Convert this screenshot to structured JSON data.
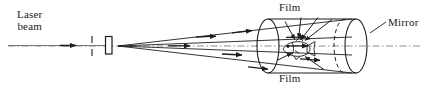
{
  "figure": {
    "domain": "diagram",
    "width": 426,
    "height": 88,
    "background": "#ffffff",
    "ink_color": "#1a1a1a",
    "ray_color": "#222222",
    "axis_color": "#8a8a8a"
  },
  "labels": {
    "laser_line1": "Laser",
    "laser_line2": "beam",
    "film_top": "Film",
    "film_bottom": "Film",
    "mirror": "Mirror"
  },
  "components": {
    "laser_beam": {
      "name": "laser-beam-line",
      "x_start": 8,
      "x_end": 108,
      "y": 45,
      "arrow_at_x": 74
    },
    "pinhole": {
      "name": "pinhole-aperture",
      "x": 92,
      "y_top": 36,
      "y_bottom": 54
    },
    "lens": {
      "name": "diverging-lens",
      "x": 106,
      "y_top": 36,
      "y_bottom": 54,
      "width": 7
    },
    "beam_origin": {
      "x": 118,
      "y": 46
    },
    "cylinder": {
      "name": "film-cylinder",
      "left_center_x": 268,
      "right_center_x": 356,
      "center_y": 46,
      "rx": 11,
      "ry": 27
    },
    "optical_axis": {
      "name": "optical-axis",
      "y": 46,
      "x_start": 8,
      "x_end": 420,
      "style": "dash-dot"
    },
    "object": {
      "name": "fish-object",
      "center_x": 300,
      "center_y": 49,
      "facing": "left"
    },
    "mirror_leader": {
      "x_start": 385,
      "y_start": 22,
      "x_end": 371,
      "y_end": 34
    }
  },
  "rays": {
    "expanding_cone": [
      {
        "x1": 118,
        "y1": 46,
        "x2": 352,
        "y2": 19,
        "arrow_t": 0.56
      },
      {
        "x1": 118,
        "y1": 46,
        "x2": 352,
        "y2": 37,
        "arrow_t": 0.5
      },
      {
        "x1": 118,
        "y1": 46,
        "x2": 352,
        "y2": 55,
        "arrow_t": 0.52
      },
      {
        "x1": 118,
        "y1": 46,
        "x2": 352,
        "y2": 73,
        "arrow_t": 0.58
      }
    ],
    "object_illumination": [
      {
        "x1": 330,
        "y1": 20,
        "x2": 303,
        "y2": 41
      },
      {
        "x1": 316,
        "y1": 18,
        "x2": 300,
        "y2": 40
      },
      {
        "x1": 300,
        "y1": 18,
        "x2": 297,
        "y2": 39
      },
      {
        "x1": 284,
        "y1": 22,
        "x2": 295,
        "y2": 40
      },
      {
        "x1": 322,
        "y1": 70,
        "x2": 303,
        "y2": 57
      }
    ]
  }
}
